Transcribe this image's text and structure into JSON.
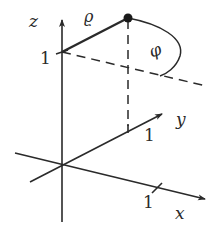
{
  "diagram": {
    "type": "3d-cylindrical-coordinates",
    "axes": {
      "x": {
        "label": "x",
        "tick_label": "1"
      },
      "y": {
        "label": "y",
        "tick_label": "1"
      },
      "z": {
        "label": "z",
        "tick_label": "1"
      }
    },
    "annotations": {
      "rho": "ϱ",
      "phi": "φ"
    },
    "colors": {
      "stroke": "#2a2a2a",
      "background": "#ffffff"
    }
  }
}
